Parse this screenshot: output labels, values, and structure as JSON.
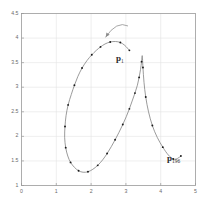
{
  "figure": {
    "background_color": "#ffffff",
    "frame_color": "#9a9a9a",
    "grid_color": "#e2e2e2",
    "curve_color": "#7a7a7a",
    "marker_color": "#1a1a1a",
    "text_color": "#6a6a6a"
  },
  "annotations": {
    "p1": {
      "base": "p",
      "sub": "1"
    },
    "p196": {
      "base": "p",
      "sub": "196"
    }
  },
  "chart_data": {
    "type": "line",
    "title": "",
    "subtitle": "",
    "xlabel": "",
    "ylabel": "",
    "xlim": [
      0,
      5
    ],
    "ylim": [
      1,
      4.5
    ],
    "grid": true,
    "legend": null,
    "legend_position": "none",
    "xticks": [
      "0",
      "1",
      "2",
      "3",
      "4",
      "5"
    ],
    "xtick_values": [
      0,
      1,
      2,
      3,
      4,
      5
    ],
    "yticks": [
      "1",
      "1.5",
      "2",
      "2.5",
      "3",
      "3.5",
      "4",
      "4.5"
    ],
    "ytick_values": [
      1,
      1.5,
      2,
      2.5,
      3,
      3.5,
      4,
      4.5
    ],
    "series": [
      {
        "name": "trajectory",
        "marker": "dot",
        "line": "solid",
        "x": [
          3.1,
          2.97,
          2.84,
          2.7,
          2.55,
          2.4,
          2.27,
          2.15,
          2.02,
          1.88,
          1.74,
          1.62,
          1.52,
          1.43,
          1.34,
          1.28,
          1.25,
          1.24,
          1.27,
          1.33,
          1.41,
          1.52,
          1.64,
          1.77,
          1.91,
          2.05,
          2.19,
          2.33,
          2.46,
          2.58,
          2.69,
          2.8,
          2.91,
          3.01,
          3.1,
          3.18,
          3.26,
          3.33,
          3.38,
          3.42,
          3.45,
          3.47,
          3.49,
          3.52,
          3.57,
          3.65,
          3.76,
          3.9,
          4.06,
          4.22,
          4.36,
          4.48,
          4.58
        ],
        "y": [
          3.75,
          3.85,
          3.91,
          3.93,
          3.92,
          3.88,
          3.82,
          3.75,
          3.66,
          3.54,
          3.39,
          3.22,
          3.04,
          2.85,
          2.64,
          2.42,
          2.2,
          1.98,
          1.77,
          1.6,
          1.47,
          1.37,
          1.3,
          1.27,
          1.28,
          1.33,
          1.41,
          1.52,
          1.65,
          1.79,
          1.93,
          2.08,
          2.24,
          2.4,
          2.56,
          2.72,
          2.88,
          3.04,
          3.2,
          3.36,
          3.52,
          3.64,
          3.4,
          3.1,
          2.8,
          2.5,
          2.22,
          1.98,
          1.78,
          1.62,
          1.54,
          1.55,
          1.6
        ],
        "markers_x": [
          3.1,
          2.84,
          2.55,
          2.27,
          2.02,
          1.74,
          1.52,
          1.34,
          1.25,
          1.27,
          1.41,
          1.64,
          1.91,
          2.19,
          2.46,
          2.69,
          2.91,
          3.1,
          3.26,
          3.38,
          3.45,
          3.49,
          3.57,
          3.76,
          4.06,
          4.36,
          4.58
        ],
        "markers_y": [
          3.75,
          3.91,
          3.92,
          3.82,
          3.66,
          3.39,
          3.04,
          2.64,
          2.2,
          1.77,
          1.47,
          1.3,
          1.28,
          1.41,
          1.65,
          1.93,
          2.24,
          2.56,
          2.88,
          3.2,
          3.52,
          3.4,
          2.8,
          2.22,
          1.78,
          1.54,
          1.6
        ]
      }
    ],
    "annotation_arrow": {
      "description": "curved arrow above apex pointing left-down toward curve",
      "from": [
        3.05,
        4.25
      ],
      "to": [
        2.42,
        4.02
      ]
    },
    "point_labels": [
      {
        "text": "p_1",
        "x": 2.85,
        "y": 3.62
      },
      {
        "text": "p_196",
        "x": 4.3,
        "y": 1.8
      }
    ]
  }
}
